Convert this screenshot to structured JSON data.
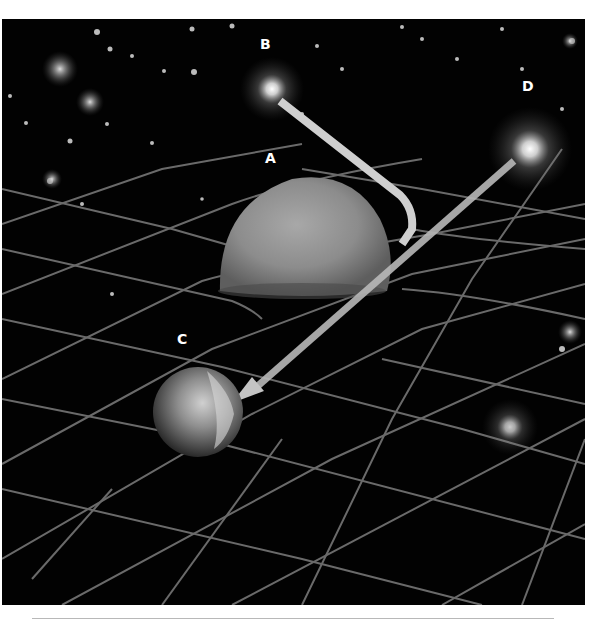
{
  "diagram": {
    "labels": {
      "A": "A",
      "B": "B",
      "C": "C",
      "D": "D"
    },
    "objects": [
      {
        "id": "A",
        "kind": "massive-body",
        "label": "A"
      },
      {
        "id": "B",
        "kind": "star",
        "label": "B"
      },
      {
        "id": "C",
        "kind": "planet-observer",
        "label": "C"
      },
      {
        "id": "D",
        "kind": "star",
        "label": "D"
      }
    ],
    "paths": [
      {
        "from": "B",
        "to": "C",
        "kind": "bent-light-ray",
        "bends_around": "A"
      },
      {
        "from": "D",
        "to": "C",
        "kind": "apparent-straight-ray"
      }
    ],
    "colors": {
      "background": "#020202",
      "grid": "#6e6e6e",
      "ray": "#c8c8c8",
      "body_a": "#8a8a8a",
      "planet_c": "#9a9a9a",
      "label": "#ffffff"
    }
  }
}
